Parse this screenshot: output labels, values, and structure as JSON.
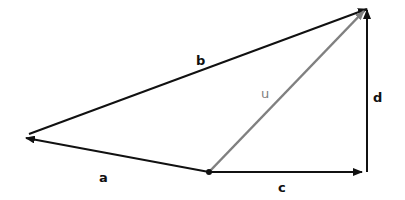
{
  "diagram": {
    "type": "vector-diagram",
    "colors": {
      "primary": "#111111",
      "resultant": "#808080",
      "background": "#ffffff"
    },
    "origin": {
      "x": 209,
      "y": 172
    },
    "vectors": [
      {
        "id": "a",
        "label": "a",
        "from": [
          209,
          172
        ],
        "to": [
          25,
          138
        ],
        "color": "#111111"
      },
      {
        "id": "b",
        "label": "b",
        "from": [
          29,
          134
        ],
        "to": [
          368,
          8
        ],
        "color": "#111111"
      },
      {
        "id": "c",
        "label": "c",
        "from": [
          209,
          172
        ],
        "to": [
          362,
          172
        ],
        "color": "#111111"
      },
      {
        "id": "d",
        "label": "d",
        "from": [
          367,
          172
        ],
        "to": [
          367,
          10
        ],
        "color": "#111111"
      },
      {
        "id": "u",
        "label": "u",
        "from": [
          209,
          172
        ],
        "to": [
          365,
          10
        ],
        "color": "#808080"
      }
    ],
    "labels": {
      "a": "a",
      "b": "b",
      "c": "c",
      "d": "d",
      "u": "u"
    }
  }
}
